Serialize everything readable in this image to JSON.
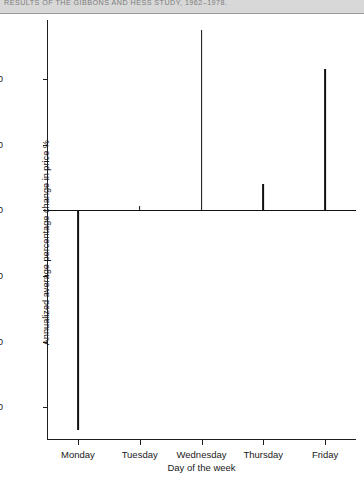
{
  "page_header": {
    "title": "RESULTS OF THE GIBBONS AND HESS STUDY, 1962–1978."
  },
  "chart_data": {
    "type": "bar",
    "title": "RESULTS OF THE GIBBONS AND HESS STUDY, 1962–1978.",
    "xlabel": "Day of the week",
    "ylabel": "Annualized average percentage change in price %",
    "categories": [
      "Monday",
      "Tuesday",
      "Wednesday",
      "Thursday",
      "Friday"
    ],
    "values": [
      -33.5,
      0.7,
      27.5,
      4.0,
      21.5
    ],
    "ylim": [
      -35,
      29
    ],
    "ytick_values": [
      20,
      10,
      0,
      -10,
      -20,
      -30
    ],
    "ytick_labels": [
      "+20",
      "+10",
      "0",
      "−10",
      "−20",
      "−30"
    ],
    "grid": false,
    "legend": false,
    "bar_color": "#111111",
    "axis_color": "#1e1e1e"
  }
}
